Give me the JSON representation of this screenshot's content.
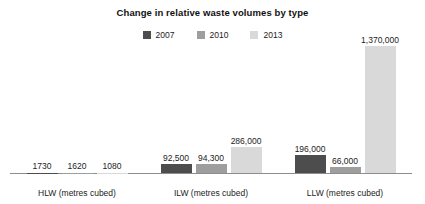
{
  "chart_data": {
    "type": "bar",
    "title": "Change in relative waste volumes by type",
    "xlabel": "",
    "ylabel": "",
    "grid": false,
    "legend_position": "top-center",
    "categories": [
      "HLW (metres cubed)",
      "ILW (metres cubed)",
      "LLW (metres cubed)"
    ],
    "series": [
      {
        "name": "2007",
        "color": "#4d4d4d",
        "values": [
          1730,
          92500,
          196000
        ],
        "labels": [
          "1730",
          "92,500",
          "196,000"
        ]
      },
      {
        "name": "2010",
        "color": "#9e9e9e",
        "values": [
          1620,
          94300,
          66000
        ],
        "labels": [
          "1620",
          "94,300",
          "66,000"
        ]
      },
      {
        "name": "2013",
        "color": "#d9d9d9",
        "values": [
          1080,
          286000,
          1370000
        ],
        "labels": [
          "1080",
          "286,000",
          "1,370,000"
        ]
      }
    ],
    "ylim": [
      0,
      1370000
    ],
    "axis_line_color": "#8d8d8d"
  },
  "legend": {
    "items": [
      {
        "label": "2007"
      },
      {
        "label": "2010"
      },
      {
        "label": "2013"
      }
    ]
  },
  "groups": [
    {
      "label": "HLW (metres cubed)",
      "bars": [
        {
          "label": "1730"
        },
        {
          "label": "1620"
        },
        {
          "label": "1080"
        }
      ]
    },
    {
      "label": "ILW (metres cubed)",
      "bars": [
        {
          "label": "92,500"
        },
        {
          "label": "94,300"
        },
        {
          "label": "286,000"
        }
      ]
    },
    {
      "label": "LLW (metres cubed)",
      "bars": [
        {
          "label": "196,000"
        },
        {
          "label": "66,000"
        },
        {
          "label": "1,370,000"
        }
      ]
    }
  ]
}
